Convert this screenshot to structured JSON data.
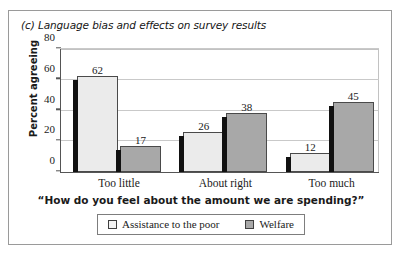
{
  "figure": {
    "title": "(c) Language bias and effects on survey results"
  },
  "legend": {
    "items": [
      {
        "label": "Assistance to the poor",
        "swatch": "light-swatch-icon",
        "color": "#ebebeb"
      },
      {
        "label": "Welfare",
        "swatch": "gray-swatch-icon",
        "color": "#a8a8a8"
      }
    ]
  },
  "chart_data": {
    "type": "bar",
    "title": "(c) Language bias and effects on survey results",
    "xlabel": "“How do you feel about the amount we are spending?”",
    "ylabel": "Percent agreeing",
    "categories": [
      "Too little",
      "About right",
      "Too much"
    ],
    "series": [
      {
        "name": "Assistance to the poor",
        "values": [
          62,
          26,
          12
        ],
        "color": "#ebebeb"
      },
      {
        "name": "Welfare",
        "values": [
          17,
          38,
          45
        ],
        "color": "#a8a8a8"
      }
    ],
    "ylim": [
      0,
      80
    ],
    "yticks": [
      0,
      20,
      40,
      60,
      80
    ],
    "ytick_labels": [
      "0",
      "20",
      "40",
      "60",
      "80"
    ],
    "grid": true,
    "grid_axis": "y",
    "legend_position": "bottom",
    "data_labels": [
      62,
      17,
      26,
      38,
      12,
      45
    ]
  }
}
